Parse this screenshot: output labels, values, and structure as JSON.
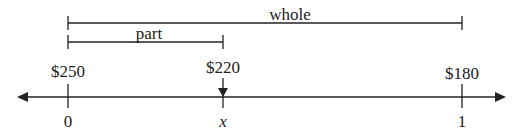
{
  "diagram": {
    "type": "number-line-percent-model",
    "brackets": {
      "whole": {
        "label": "whole",
        "from": "0",
        "to": "1"
      },
      "part": {
        "label": "part",
        "from": "0",
        "to": "x"
      }
    },
    "ticks": [
      {
        "top_label": "$250",
        "bottom_label": "0"
      },
      {
        "top_label": "$220",
        "bottom_label": "x",
        "marker": "down-arrow"
      },
      {
        "top_label": "$180",
        "bottom_label": "1"
      }
    ],
    "axis": {
      "arrows": "both"
    },
    "colors": {
      "ink": "#222222",
      "background": "#ffffff"
    }
  }
}
